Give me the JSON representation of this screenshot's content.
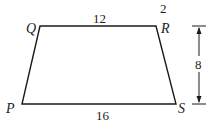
{
  "figure": {
    "type": "trapezoid",
    "stray_text": "2",
    "vertices": {
      "Q": {
        "label": "Q",
        "x": 40,
        "y": 26
      },
      "R": {
        "label": "R",
        "x": 156,
        "y": 26
      },
      "S": {
        "label": "S",
        "x": 176,
        "y": 104
      },
      "P": {
        "label": "P",
        "x": 22,
        "y": 104
      }
    },
    "measurements": {
      "top_QR": "12",
      "bottom_PS": "16",
      "height": "8"
    },
    "colors": {
      "stroke": "#1a1a1a",
      "background": "#ffffff"
    }
  }
}
